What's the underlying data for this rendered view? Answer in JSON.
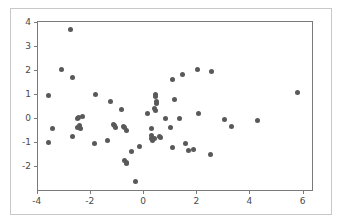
{
  "figure": {
    "background_color": "#ffffff",
    "frame_color": "#c8c8c8",
    "axes_color": "#7a7a7a",
    "marker_color": "#595959",
    "tick_label_color": "#4a4a4a"
  },
  "chart_data": {
    "type": "scatter",
    "title": "",
    "xlabel": "",
    "ylabel": "",
    "xlim": [
      -3.95,
      6.35
    ],
    "ylim": [
      -3.0,
      4.0
    ],
    "grid": false,
    "legend": null,
    "xticks": [
      -4,
      -2,
      0,
      2,
      4,
      6
    ],
    "xticklabels": [
      "-4",
      "-2",
      "0",
      "2",
      "4",
      "6"
    ],
    "yticks": [
      -2,
      -1,
      0,
      1,
      2,
      3,
      4
    ],
    "yticklabels": [
      "-2",
      "-1",
      "0",
      "1",
      "2",
      "3",
      "4"
    ],
    "marker": "circle",
    "marker_size": 5,
    "n_points": 62,
    "points": [
      [
        -2.72,
        3.67
      ],
      [
        -3.05,
        2.02
      ],
      [
        -2.64,
        1.67
      ],
      [
        -3.55,
        0.93
      ],
      [
        -1.8,
        0.97
      ],
      [
        -2.46,
        0.0
      ],
      [
        -2.29,
        0.06
      ],
      [
        -3.4,
        -0.42
      ],
      [
        -2.38,
        -0.31
      ],
      [
        -2.36,
        -0.45
      ],
      [
        -2.64,
        -0.79
      ],
      [
        -3.55,
        -1.04
      ],
      [
        -1.82,
        -1.05
      ],
      [
        -1.35,
        -0.95
      ],
      [
        -1.22,
        0.68
      ],
      [
        -1.12,
        -0.25
      ],
      [
        -1.07,
        -0.33
      ],
      [
        -0.8,
        0.35
      ],
      [
        -0.73,
        -0.36
      ],
      [
        -0.62,
        -0.52
      ],
      [
        -0.68,
        -1.79
      ],
      [
        -0.63,
        -1.84
      ],
      [
        -0.44,
        -1.39
      ],
      [
        -0.3,
        -2.63
      ],
      [
        -0.12,
        -1.18
      ],
      [
        0.16,
        0.18
      ],
      [
        0.3,
        -0.42
      ],
      [
        0.33,
        -0.73
      ],
      [
        0.3,
        -0.86
      ],
      [
        0.42,
        -0.84
      ],
      [
        0.45,
        0.98
      ],
      [
        0.47,
        0.89
      ],
      [
        0.5,
        0.7
      ],
      [
        0.52,
        0.62
      ],
      [
        0.44,
        0.4
      ],
      [
        0.48,
        0.33
      ],
      [
        0.62,
        -0.77
      ],
      [
        0.86,
        -0.02
      ],
      [
        1.04,
        -0.38
      ],
      [
        1.11,
        1.6
      ],
      [
        1.18,
        0.76
      ],
      [
        1.12,
        -1.24
      ],
      [
        1.36,
        -0.04
      ],
      [
        1.47,
        1.82
      ],
      [
        1.6,
        -1.06
      ],
      [
        1.72,
        -1.35
      ],
      [
        2.05,
        2.02
      ],
      [
        2.08,
        0.18
      ],
      [
        2.57,
        1.93
      ],
      [
        2.52,
        -1.53
      ],
      [
        3.07,
        -0.08
      ],
      [
        3.34,
        -0.37
      ],
      [
        4.3,
        -0.1
      ],
      [
        5.82,
        1.05
      ],
      [
        -2.48,
        -0.4
      ],
      [
        -1.05,
        -0.4
      ],
      [
        -0.68,
        -0.4
      ],
      [
        0.35,
        -0.93
      ],
      [
        0.66,
        -0.8
      ],
      [
        1.9,
        -1.3
      ],
      [
        -2.42,
        0.02
      ],
      [
        -0.62,
        -1.88
      ]
    ]
  }
}
